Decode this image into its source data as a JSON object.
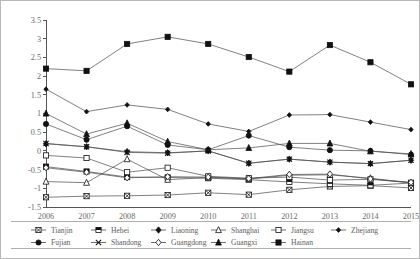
{
  "figure": {
    "frame_color": "#b8b8b8",
    "background": "#ffffff",
    "axis_color": "#555555",
    "line_color": "#4a4a4a",
    "marker_color": "#111111"
  },
  "chart_data": {
    "type": "line",
    "title": "",
    "subtitle": "",
    "xlabel": "",
    "ylabel": "",
    "grid": false,
    "legend_position": "bottom",
    "legend_columns": 6,
    "x": [
      "2006",
      "2007",
      "2008",
      "2009",
      "2010",
      "2011",
      "2012",
      "2013",
      "2014",
      "2015"
    ],
    "categories": [
      "2006",
      "2007",
      "2008",
      "2009",
      "2010",
      "2011",
      "2012",
      "2013",
      "2014",
      "2015"
    ],
    "xlim": [
      2006,
      2015
    ],
    "ylim": [
      -1.5,
      3.5
    ],
    "yticks": [
      -1.5,
      -1,
      -0.5,
      0,
      0.5,
      1,
      1.5,
      2,
      2.5,
      3,
      3.5
    ],
    "ytick_labels": [
      "-1.5",
      "-1",
      "-0.5",
      "0",
      "0.5",
      "1",
      "1.5",
      "2",
      "2.5",
      "3",
      "3.5"
    ],
    "xtick_labels": [
      "2006",
      "2007",
      "2008",
      "2009",
      "2010",
      "2011",
      "2012",
      "2013",
      "2014",
      "2015"
    ],
    "series": [
      {
        "name": "Tianjin",
        "marker": "square-crossed",
        "values": [
          -1.24,
          -1.21,
          -1.2,
          -1.18,
          -1.12,
          -1.17,
          -1.04,
          -0.95,
          -0.93,
          -0.99
        ]
      },
      {
        "name": "Hebei",
        "marker": "square-half",
        "values": [
          -0.42,
          -0.55,
          -0.7,
          -0.71,
          -0.73,
          -0.77,
          -0.83,
          -0.88,
          -0.92,
          -0.86
        ]
      },
      {
        "name": "Liaoning",
        "marker": "diamond-filled",
        "values": [
          0.19,
          0.11,
          -0.02,
          -0.05,
          0.0,
          -0.33,
          -0.22,
          -0.3,
          -0.34,
          -0.25
        ]
      },
      {
        "name": "Shanghai",
        "marker": "triangle-open",
        "values": [
          -0.82,
          -0.85,
          -0.22,
          -0.77,
          -0.71,
          -0.75,
          -0.65,
          -0.64,
          -0.73,
          -0.86
        ]
      },
      {
        "name": "Jiangsu",
        "marker": "square-open",
        "values": [
          -0.12,
          -0.19,
          -0.57,
          -0.45,
          -0.68,
          -0.73,
          -0.7,
          -0.78,
          -0.76,
          -0.85
        ]
      },
      {
        "name": "Zhejiang",
        "marker": "diamond-small",
        "values": [
          1.65,
          1.05,
          1.23,
          1.11,
          0.72,
          0.52,
          0.96,
          0.97,
          0.77,
          0.57
        ]
      },
      {
        "name": "Fujian",
        "marker": "circle-filled",
        "values": [
          0.72,
          0.3,
          0.66,
          0.16,
          0.03,
          0.41,
          0.1,
          0.02,
          0.0,
          -0.1
        ]
      },
      {
        "name": "Shandong",
        "marker": "x-cross",
        "values": [
          0.2,
          0.11,
          -0.04,
          -0.06,
          0.0,
          -0.33,
          -0.22,
          -0.3,
          -0.34,
          -0.25
        ]
      },
      {
        "name": "Guangdong",
        "marker": "diamond-open",
        "values": [
          -0.45,
          -0.57,
          -0.72,
          -0.69,
          -0.7,
          -0.74,
          -0.63,
          -0.62,
          -0.75,
          -0.84
        ]
      },
      {
        "name": "Guangxi",
        "marker": "triangle-filled",
        "values": [
          1.0,
          0.45,
          0.74,
          0.25,
          0.03,
          0.08,
          0.2,
          0.2,
          -0.01,
          -0.08
        ]
      },
      {
        "name": "Hainan",
        "marker": "square-filled",
        "values": [
          2.2,
          2.14,
          2.86,
          3.05,
          2.86,
          2.51,
          2.12,
          2.83,
          2.37,
          1.78
        ]
      }
    ]
  },
  "legend": {
    "rows": [
      [
        "Tianjin",
        "Hebei",
        "Liaoning",
        "Shanghai",
        "Jiangsu",
        "Zhejiang"
      ],
      [
        "Fujian",
        "Shandong",
        "Guangdong",
        "Guangxi",
        "Hainan"
      ]
    ]
  }
}
